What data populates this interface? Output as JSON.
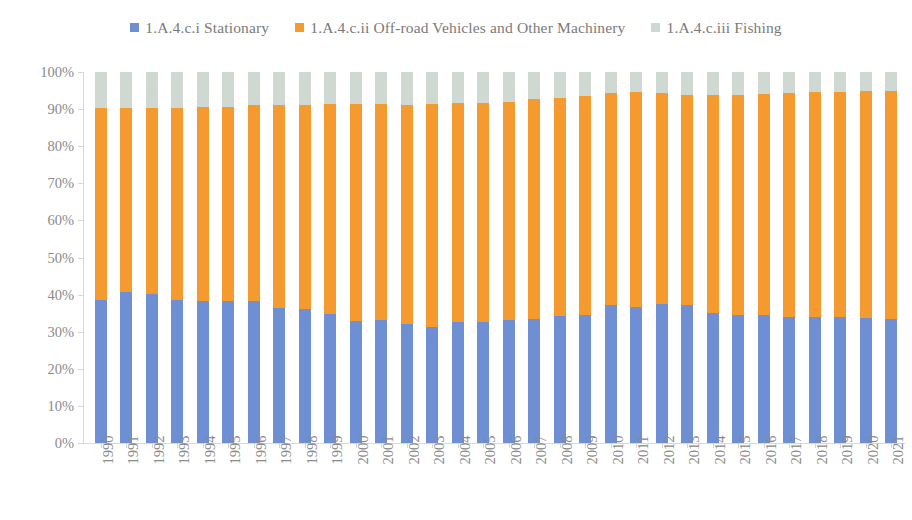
{
  "chart_data": {
    "type": "bar",
    "subtype": "stacked-100-percent",
    "title": "",
    "xlabel": "",
    "ylabel": "",
    "ylim": [
      0,
      100
    ],
    "ytick_labels": [
      "100%",
      "90%",
      "80%",
      "70%",
      "60%",
      "50%",
      "40%",
      "30%",
      "20%",
      "10%",
      "0%"
    ],
    "ytick_values": [
      100,
      90,
      80,
      70,
      60,
      50,
      40,
      30,
      20,
      10,
      0
    ],
    "grid": false,
    "legend_position": "top-center",
    "categories": [
      "1990",
      "1991",
      "1992",
      "1993",
      "1994",
      "1995",
      "1996",
      "1997",
      "1998",
      "1999",
      "2000",
      "2001",
      "2002",
      "2003",
      "2004",
      "2005",
      "2006",
      "2007",
      "2008",
      "2009",
      "2010",
      "2011",
      "2012",
      "2013",
      "2014",
      "2015",
      "2016",
      "2017",
      "2018",
      "2019",
      "2020",
      "2021"
    ],
    "series": [
      {
        "name": "1.A.4.c.i  Stationary",
        "color": "#6e8fd4",
        "values": [
          38.5,
          40.8,
          40.2,
          38.5,
          38.3,
          38.2,
          38.3,
          36.4,
          36.1,
          34.8,
          32.8,
          33.2,
          32.1,
          31.3,
          32.6,
          32.5,
          33.1,
          33.4,
          34.2,
          34.4,
          37.3,
          36.7,
          37.4,
          37.2,
          35.0,
          34.6,
          34.5,
          34.1,
          34.1,
          33.9,
          33.6,
          33.4
        ]
      },
      {
        "name": "1.A.4.c.ii  Off-road Vehicles and Other Machinery",
        "color": "#f59a2e",
        "values": [
          51.8,
          49.4,
          50.0,
          51.9,
          52.2,
          52.4,
          52.7,
          54.7,
          55.1,
          56.6,
          58.7,
          58.2,
          59.1,
          60.2,
          59.0,
          59.1,
          58.8,
          59.2,
          58.9,
          59.2,
          57.0,
          58.0,
          57.0,
          56.5,
          58.9,
          59.3,
          59.5,
          60.2,
          60.5,
          60.8,
          61.2,
          61.4
        ]
      },
      {
        "name": "1.A.4.c.iii  Fishing",
        "color": "#cfd9d2",
        "values": [
          9.7,
          9.8,
          9.8,
          9.6,
          9.5,
          9.4,
          9.0,
          8.9,
          8.8,
          8.6,
          8.5,
          8.6,
          8.8,
          8.5,
          8.4,
          8.4,
          8.1,
          7.4,
          6.9,
          6.4,
          5.7,
          5.3,
          5.6,
          6.3,
          6.1,
          6.1,
          6.0,
          5.7,
          5.4,
          5.3,
          5.2,
          5.2
        ]
      }
    ]
  },
  "legend": {
    "items": [
      {
        "label": "1.A.4.c.i  Stationary",
        "color": "#6e8fd4"
      },
      {
        "label": "1.A.4.c.ii  Off-road Vehicles and Other Machinery",
        "color": "#f59a2e"
      },
      {
        "label": "1.A.4.c.iii  Fishing",
        "color": "#cfd9d2"
      }
    ]
  }
}
